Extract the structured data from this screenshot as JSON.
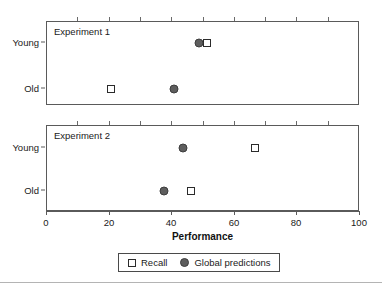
{
  "chart_data": {
    "type": "scatter",
    "title": "",
    "xlabel": "Performance",
    "ylabel": "",
    "xlim": [
      0,
      100
    ],
    "xticks": [
      0,
      20,
      40,
      60,
      80,
      100
    ],
    "xtick_labels": [
      "0",
      "20",
      "40",
      "60",
      "80",
      "100"
    ],
    "minor_xticks": [
      10,
      30,
      50,
      70,
      90
    ],
    "categories": [
      "Young",
      "Old"
    ],
    "grid": false,
    "legend_position": "bottom",
    "legend": [
      {
        "name": "Recall",
        "marker": "open-square",
        "color": "#ffffff",
        "edge": "#2b2b2b"
      },
      {
        "name": "Global predictions",
        "marker": "filled-circle",
        "color": "#5e5e5e",
        "edge": "#3d3d3d"
      }
    ],
    "panels": [
      {
        "label": "Experiment 1",
        "ytick_labels": [
          "Young",
          "Old"
        ],
        "series": [
          {
            "name": "Recall",
            "values": [
              51.0,
              20.5
            ]
          },
          {
            "name": "Global predictions",
            "values": [
              48.5,
              40.5
            ]
          }
        ]
      },
      {
        "label": "Experiment 2",
        "ytick_labels": [
          "Young",
          "Old"
        ],
        "series": [
          {
            "name": "Recall",
            "values": [
              66.5,
              46.0
            ]
          },
          {
            "name": "Global predictions",
            "values": [
              43.5,
              37.5
            ]
          }
        ]
      }
    ]
  },
  "colors": {
    "recall_fill": "#ffffff",
    "recall_edge": "#2b2b2b",
    "global_fill": "#5e5e5e",
    "global_edge": "#3d3d3d",
    "frame": "#5a5a5a",
    "text": "#1a1a1a"
  }
}
